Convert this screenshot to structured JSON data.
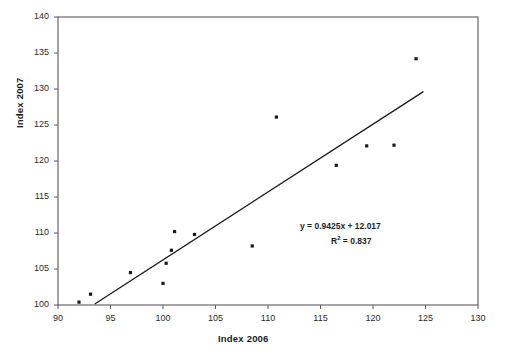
{
  "chart_data": {
    "type": "scatter",
    "title": "",
    "xlabel": "Index 2006",
    "ylabel": "Index 2007",
    "xlim": [
      90,
      130
    ],
    "ylim": [
      100,
      140
    ],
    "xticks": [
      90,
      95,
      100,
      105,
      110,
      115,
      120,
      125,
      130
    ],
    "yticks": [
      100,
      105,
      110,
      115,
      120,
      125,
      130,
      135,
      140
    ],
    "grid": false,
    "legend": false,
    "marker_color": "#1a1a1a",
    "line_color": "#1a1a1a",
    "frame_color": "#595959",
    "points": [
      {
        "x": 92.0,
        "y": 100.4
      },
      {
        "x": 93.1,
        "y": 101.5
      },
      {
        "x": 96.9,
        "y": 104.5
      },
      {
        "x": 100.0,
        "y": 103.0
      },
      {
        "x": 100.3,
        "y": 105.8
      },
      {
        "x": 100.8,
        "y": 107.6
      },
      {
        "x": 101.1,
        "y": 110.2
      },
      {
        "x": 103.0,
        "y": 109.8
      },
      {
        "x": 108.5,
        "y": 108.2
      },
      {
        "x": 110.8,
        "y": 126.1
      },
      {
        "x": 116.5,
        "y": 119.4
      },
      {
        "x": 119.4,
        "y": 122.1
      },
      {
        "x": 122.0,
        "y": 122.2
      },
      {
        "x": 124.1,
        "y": 134.2
      }
    ],
    "trendline": {
      "slope": 0.9425,
      "intercept": 12.017,
      "r_squared": 0.837,
      "x_start": 93.5,
      "x_end": 124.8,
      "equation_label": "y = 0.9425x + 12.017",
      "r2_prefix": "R",
      "r2_exponent": "2",
      "r2_value": " = 0.837"
    }
  }
}
